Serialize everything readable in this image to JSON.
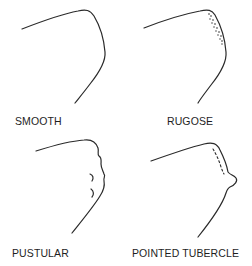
{
  "diagram": {
    "panels": [
      {
        "id": "smooth",
        "label": "SMOOTH"
      },
      {
        "id": "rugose",
        "label": "RUGOSE"
      },
      {
        "id": "pustular",
        "label": "PUSTULAR"
      },
      {
        "id": "pointed-tubercle",
        "label": "POINTED TUBERCLE"
      }
    ],
    "colors": {
      "line": "#2a2a2a",
      "text": "#1e1e1e",
      "background": "#ffffff"
    }
  }
}
